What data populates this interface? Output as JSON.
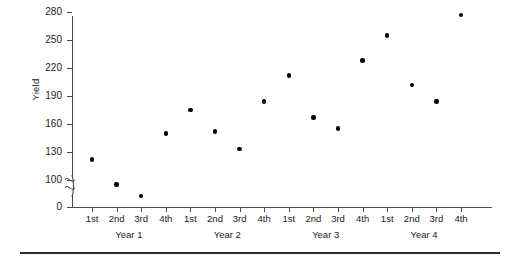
{
  "chart_data": {
    "type": "scatter",
    "title": "",
    "xlabel": "",
    "ylabel": "Yield",
    "ylim": [
      0,
      290
    ],
    "y_axis_break": true,
    "y_break_range": [
      0,
      100
    ],
    "grid": false,
    "legend": false,
    "y_ticks": [
      0,
      100,
      130,
      160,
      190,
      220,
      250,
      280
    ],
    "y_tick_labels": [
      "0",
      "100",
      "130",
      "160",
      "190",
      "220",
      "250",
      "280"
    ],
    "categories": [
      "1st",
      "2nd",
      "3rd",
      "4th",
      "1st",
      "2nd",
      "3rd",
      "4th",
      "1st",
      "2nd",
      "3rd",
      "4th",
      "1st",
      "2nd",
      "3rd",
      "4th"
    ],
    "groups": [
      "Year 1",
      "Year 2",
      "Year 3",
      "Year 4"
    ],
    "values": [
      122,
      95,
      83,
      150,
      175,
      152,
      133,
      184,
      212,
      167,
      155,
      228,
      255,
      202,
      184,
      277
    ],
    "point_color": "#000000",
    "axis_color": "#4a4a4a",
    "rule_color": "#2b2b2b"
  },
  "chart": {
    "y_axis_label": "Yield"
  }
}
